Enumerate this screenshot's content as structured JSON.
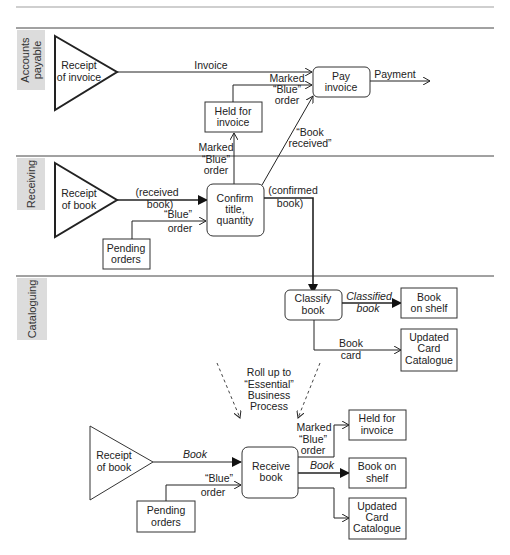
{
  "lanes": [
    {
      "label_line1": "Accounts",
      "label_line2": "payable"
    },
    {
      "label": "Receiving"
    },
    {
      "label": "Cataloguing"
    }
  ],
  "top_diagram": {
    "receipt_of_invoice": {
      "line1": "Receipt",
      "line2": "of invoice"
    },
    "receipt_of_book": {
      "line1": "Receipt",
      "line2": "of book"
    },
    "held_for_invoice": {
      "line1": "Held for",
      "line2": "invoice"
    },
    "pay_invoice": {
      "line1": "Pay",
      "line2": "invoice"
    },
    "confirm": {
      "line1": "Confirm",
      "line2": "title,",
      "line3": "quantity"
    },
    "pending_orders": {
      "line1": "Pending",
      "line2": "orders"
    },
    "classify_book": {
      "line1": "Classify",
      "line2": "book"
    },
    "book_on_shelf": {
      "line1": "Book",
      "line2": "on shelf"
    },
    "updated_card_catalogue": {
      "line1": "Updated",
      "line2": "Card",
      "line3": "Catalogue"
    },
    "flows": {
      "invoice": "Invoice",
      "payment": "Payment",
      "marked_blue_1": {
        "line1": "Marked",
        "line2": "“Blue”",
        "line3": "order"
      },
      "marked_blue_2": {
        "line1": "Marked",
        "line2": "“Blue”",
        "line3": "order"
      },
      "book_received": {
        "line1": "“Book",
        "line2": "received”"
      },
      "received_book": {
        "line1": "(received",
        "line2": "book)"
      },
      "blue_order": {
        "line1": "“Blue”",
        "line2": "order"
      },
      "confirmed_book": {
        "line1": "(confirmed",
        "line2": "book)"
      },
      "classified_book": {
        "line1": "Classified",
        "line2": "book"
      },
      "book_card": {
        "line1": "Book",
        "line2": "card"
      }
    }
  },
  "rollup_note": {
    "line1": "Roll up to",
    "line2": "“Essential”",
    "line3": "Business",
    "line4": "Process"
  },
  "bottom_diagram": {
    "receipt_of_book": {
      "line1": "Receipt",
      "line2": "of book"
    },
    "receive_book": {
      "line1": "Receive",
      "line2": "book"
    },
    "pending_orders": {
      "line1": "Pending",
      "line2": "orders"
    },
    "held_for_invoice": {
      "line1": "Held for",
      "line2": "invoice"
    },
    "book_on_shelf": {
      "line1": "Book on",
      "line2": "shelf"
    },
    "updated_card_catalogue": {
      "line1": "Updated",
      "line2": "Card",
      "line3": "Catalogue"
    },
    "flows": {
      "book_in": "Book",
      "blue_order": {
        "line1": "“Blue”",
        "line2": "order"
      },
      "marked_blue": {
        "line1": "Marked",
        "line2": "“Blue”",
        "line3": "order"
      },
      "book_out": "Book"
    }
  }
}
